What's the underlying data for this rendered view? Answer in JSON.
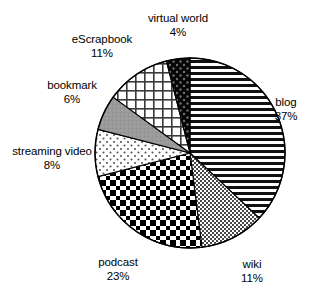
{
  "chart_data": {
    "type": "pie",
    "title": "",
    "subtitle": "",
    "xlabel": "",
    "ylabel": "",
    "legend_position": "none",
    "grid": false,
    "value_unit": "%",
    "start_angle_deg": 0,
    "direction": "clockwise",
    "categories": [
      "blog",
      "wiki",
      "podcast",
      "streaming video",
      "bookmark",
      "eScrapbook",
      "virtual world"
    ],
    "values": [
      37,
      11,
      23,
      8,
      6,
      11,
      4
    ],
    "slices": [
      {
        "label": "blog",
        "value": 37,
        "value_text": "37%",
        "fill_pattern": "horizontal-stripes",
        "fill_color": "#000000",
        "background_color": "#ffffff",
        "label_x": 286,
        "label_y": 96
      },
      {
        "label": "wiki",
        "value": 11,
        "value_text": "11%",
        "fill_pattern": "fine-checker-gray",
        "fill_color": "#555555",
        "background_color": "#ffffff",
        "label_x": 252,
        "label_y": 258
      },
      {
        "label": "podcast",
        "value": 23,
        "value_text": "23%",
        "fill_pattern": "bold-checkerboard",
        "fill_color": "#000000",
        "background_color": "#ffffff",
        "label_x": 118,
        "label_y": 256
      },
      {
        "label": "streaming video",
        "value": 8,
        "value_text": "8%",
        "fill_pattern": "sparse-dots",
        "fill_color": "#444444",
        "background_color": "#ffffff",
        "label_x": 52,
        "label_y": 145
      },
      {
        "label": "bookmark",
        "value": 6,
        "value_text": "6%",
        "fill_pattern": "solid-gray",
        "fill_color": "#9a9a9a",
        "background_color": "#9a9a9a",
        "label_x": 72,
        "label_y": 79
      },
      {
        "label": "eScrapbook",
        "value": 11,
        "value_text": "11%",
        "fill_pattern": "grid-crosshatch",
        "fill_color": "#333333",
        "background_color": "#ffffff",
        "label_x": 102,
        "label_y": 33
      },
      {
        "label": "virtual world",
        "value": 4,
        "value_text": "4%",
        "fill_pattern": "black-with-dots",
        "fill_color": "#000000",
        "background_color": "#111111",
        "label_x": 178,
        "label_y": 12
      }
    ],
    "geometry": {
      "center_x": 190,
      "center_y": 153,
      "radius": 95,
      "outline_color": "#000000"
    }
  }
}
